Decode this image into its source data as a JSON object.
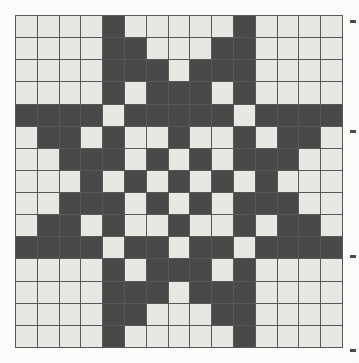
{
  "figure": {
    "rows": 15,
    "columns": 15,
    "colors": {
      "light_cell": "#eceae5",
      "dark_cell": "#4a4a4a",
      "grid_line": "#5a5a5a",
      "background": "#ffffff",
      "tick": "#4a4a4a"
    },
    "legend": {
      "dark_label": "filled",
      "light_label": "empty"
    }
  },
  "chart_data": {
    "type": "heatmap",
    "title": "",
    "xlabel": "",
    "ylabel": "",
    "grid": true,
    "legend_position": "none",
    "x": [
      0,
      1,
      2,
      3,
      4,
      5,
      6,
      7,
      8,
      9,
      10,
      11,
      12,
      13,
      14
    ],
    "y": [
      0,
      1,
      2,
      3,
      4,
      5,
      6,
      7,
      8,
      9,
      10,
      11,
      12,
      13,
      14
    ],
    "value_labels": {
      "0": "light",
      "1": "dark"
    },
    "values": [
      [
        0,
        0,
        0,
        0,
        1,
        0,
        0,
        0,
        0,
        0,
        1,
        0,
        0,
        0,
        0
      ],
      [
        0,
        0,
        0,
        0,
        1,
        1,
        0,
        0,
        0,
        1,
        1,
        0,
        0,
        0,
        0
      ],
      [
        0,
        0,
        0,
        0,
        1,
        1,
        1,
        0,
        1,
        1,
        1,
        0,
        0,
        0,
        0
      ],
      [
        0,
        0,
        0,
        0,
        1,
        0,
        1,
        1,
        1,
        0,
        1,
        0,
        0,
        0,
        0
      ],
      [
        1,
        1,
        1,
        1,
        0,
        1,
        1,
        1,
        1,
        1,
        0,
        1,
        1,
        1,
        1
      ],
      [
        0,
        1,
        1,
        0,
        1,
        0,
        0,
        1,
        0,
        0,
        1,
        0,
        1,
        1,
        0
      ],
      [
        0,
        0,
        1,
        1,
        1,
        0,
        1,
        0,
        1,
        0,
        1,
        1,
        1,
        0,
        0
      ],
      [
        0,
        0,
        0,
        1,
        0,
        1,
        0,
        1,
        0,
        1,
        0,
        1,
        0,
        0,
        0
      ],
      [
        0,
        0,
        1,
        1,
        1,
        0,
        1,
        0,
        1,
        0,
        1,
        1,
        1,
        0,
        0
      ],
      [
        0,
        1,
        1,
        0,
        1,
        0,
        0,
        1,
        0,
        0,
        1,
        0,
        1,
        1,
        0
      ],
      [
        1,
        1,
        1,
        1,
        0,
        1,
        1,
        0,
        1,
        1,
        0,
        1,
        1,
        1,
        1
      ],
      [
        0,
        0,
        0,
        0,
        1,
        0,
        1,
        1,
        1,
        0,
        1,
        0,
        0,
        0,
        0
      ],
      [
        0,
        0,
        0,
        0,
        1,
        1,
        1,
        0,
        1,
        1,
        1,
        0,
        0,
        0,
        0
      ],
      [
        0,
        0,
        0,
        0,
        1,
        1,
        0,
        0,
        0,
        1,
        1,
        0,
        0,
        0,
        0
      ],
      [
        0,
        0,
        0,
        0,
        1,
        0,
        0,
        0,
        0,
        0,
        1,
        0,
        0,
        0,
        0
      ]
    ]
  },
  "ticks": [
    {
      "name": "tick-1",
      "top": 20
    },
    {
      "name": "tick-2",
      "top": 130
    },
    {
      "name": "tick-3",
      "top": 255
    },
    {
      "name": "tick-4",
      "top": 349
    }
  ]
}
